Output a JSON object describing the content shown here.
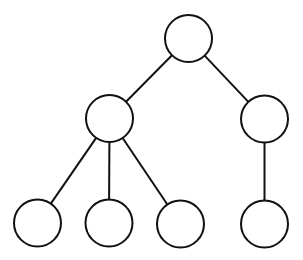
{
  "diagram": {
    "type": "tree",
    "background": "#ffffff",
    "stroke_color": "#111111",
    "stroke_width": 2,
    "node_radius": 23.5,
    "nodes": [
      {
        "id": "root",
        "cx": 188.5,
        "cy": 38.5,
        "label": ""
      },
      {
        "id": "left-mid",
        "cx": 109.5,
        "cy": 118.5,
        "label": ""
      },
      {
        "id": "right-mid",
        "cx": 264.5,
        "cy": 119,
        "label": ""
      },
      {
        "id": "leaf-1",
        "cx": 37.5,
        "cy": 223,
        "label": ""
      },
      {
        "id": "leaf-2",
        "cx": 109,
        "cy": 223,
        "label": ""
      },
      {
        "id": "leaf-3",
        "cx": 180.5,
        "cy": 224,
        "label": ""
      },
      {
        "id": "leaf-4",
        "cx": 264.5,
        "cy": 224,
        "label": ""
      }
    ],
    "edges": [
      {
        "from": "root",
        "to": "left-mid"
      },
      {
        "from": "root",
        "to": "right-mid"
      },
      {
        "from": "left-mid",
        "to": "leaf-1"
      },
      {
        "from": "left-mid",
        "to": "leaf-2"
      },
      {
        "from": "left-mid",
        "to": "leaf-3"
      },
      {
        "from": "right-mid",
        "to": "leaf-4"
      }
    ]
  }
}
